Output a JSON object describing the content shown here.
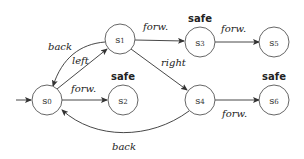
{
  "diagram": {
    "type": "state-machine",
    "initial_state": "s0",
    "nodes": [
      {
        "id": "s0",
        "label": "s0",
        "safe": false
      },
      {
        "id": "s1",
        "label": "s1",
        "safe": false
      },
      {
        "id": "s2",
        "label": "s2",
        "safe": true
      },
      {
        "id": "s3",
        "label": "s3",
        "safe": true
      },
      {
        "id": "s4",
        "label": "s4",
        "safe": false
      },
      {
        "id": "s5",
        "label": "s5",
        "safe": false
      },
      {
        "id": "s6",
        "label": "s6",
        "safe": true
      }
    ],
    "edges": [
      {
        "from": "s0",
        "to": "s1",
        "label": "left"
      },
      {
        "from": "s1",
        "to": "s0",
        "label": "back"
      },
      {
        "from": "s0",
        "to": "s2",
        "label": "forw."
      },
      {
        "from": "s1",
        "to": "s3",
        "label": "forw."
      },
      {
        "from": "s1",
        "to": "s4",
        "label": "right"
      },
      {
        "from": "s3",
        "to": "s5",
        "label": "forw."
      },
      {
        "from": "s4",
        "to": "s6",
        "label": "forw."
      },
      {
        "from": "s4",
        "to": "s0",
        "label": "back"
      }
    ],
    "safe_label": "safe"
  }
}
